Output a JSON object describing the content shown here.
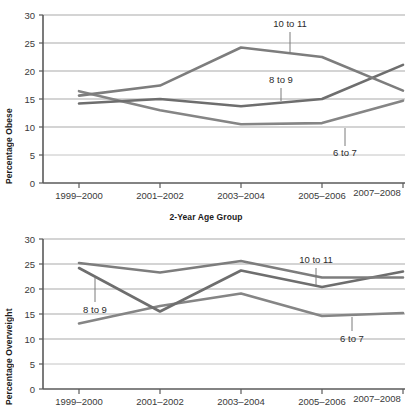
{
  "chart_data": [
    {
      "type": "line",
      "title": "",
      "xlabel": "2-Year Age Group",
      "ylabel": "Percentage Obese",
      "categories": [
        "1999–2000",
        "2001–2002",
        "2003–2004",
        "2005–2006",
        "2007–2008"
      ],
      "ylim": [
        0,
        30
      ],
      "yticks": [
        0,
        5,
        10,
        15,
        20,
        25,
        30
      ],
      "grid": true,
      "legend": "inline-annotations",
      "series": [
        {
          "name": "6 to 7",
          "values": [
            16.4,
            13.0,
            10.5,
            10.7,
            14.7
          ]
        },
        {
          "name": "8 to 9",
          "values": [
            14.2,
            15.0,
            13.7,
            15.0,
            21.1
          ]
        },
        {
          "name": "10 to 11",
          "values": [
            15.6,
            17.4,
            24.2,
            22.5,
            16.5
          ]
        }
      ],
      "annotations": [
        {
          "label": "10 to 11",
          "target_category": "2005–2006"
        },
        {
          "label": "8 to 9",
          "target_category": "2005–2006"
        },
        {
          "label": "6 to 7",
          "target_category": "2007–2008"
        }
      ]
    },
    {
      "type": "line",
      "title": "",
      "xlabel": "",
      "ylabel": "Percentage Overweight",
      "categories": [
        "1999–2000",
        "2001–2002",
        "2003–2004",
        "2005–2006",
        "2007–2008"
      ],
      "ylim": [
        0,
        30
      ],
      "yticks": [
        0,
        5,
        10,
        15,
        20,
        25,
        30
      ],
      "grid": true,
      "legend": "inline-annotations",
      "series": [
        {
          "name": "6 to 7",
          "values": [
            13.1,
            16.6,
            19.1,
            14.6,
            15.2
          ]
        },
        {
          "name": "8 to 9",
          "values": [
            24.2,
            15.5,
            23.7,
            20.4,
            23.5
          ]
        },
        {
          "name": "10 to 11",
          "values": [
            25.2,
            23.3,
            25.6,
            22.3,
            22.3
          ]
        }
      ],
      "annotations": [
        {
          "label": "8 to 9",
          "target_category": "1999–2000"
        },
        {
          "label": "10 to 11",
          "target_category": "2005–2006"
        },
        {
          "label": "6 to 7",
          "target_category": "2007–2008"
        }
      ]
    }
  ],
  "charts": {
    "obese": {
      "ylabel": "Percentage Obese",
      "yticks": [
        "30",
        "25",
        "20",
        "15",
        "10",
        "5",
        "0"
      ],
      "xticks": [
        "1999–2000",
        "2001–2002",
        "2003–2004",
        "2005–2006",
        "2007–2008"
      ],
      "annot_10_11": "10 to 11",
      "annot_8_9": "8 to 9",
      "annot_6_7": "6 to 7"
    },
    "overweight": {
      "ylabel": "Percentage Overweight",
      "yticks": [
        "30",
        "25",
        "20",
        "15",
        "10",
        "5",
        "0"
      ],
      "xticks": [
        "1999–2000",
        "2001–2002",
        "2003–2004",
        "2005–2006",
        "2007–2008"
      ],
      "annot_10_11": "10 to 11",
      "annot_8_9": "8 to 9",
      "annot_6_7": "6 to 7"
    }
  },
  "xaxis_title": "2-Year Age Group",
  "colors": {
    "line": "#7a7a7a",
    "line_dark": "#5e5e5e",
    "grid": "#aaaaaa",
    "axis": "#4a4a4a",
    "text": "#2b2b2b"
  }
}
